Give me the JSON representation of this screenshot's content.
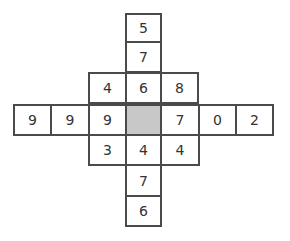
{
  "puzzle": {
    "colors": {
      "border": "#4a4a4a",
      "shaded": "#c8c8c8",
      "text": "#333333"
    },
    "cells": [
      {
        "row": 0,
        "col": 3,
        "value": "5"
      },
      {
        "row": 1,
        "col": 3,
        "value": "7"
      },
      {
        "row": 2,
        "col": 2,
        "value": "4"
      },
      {
        "row": 2,
        "col": 3,
        "value": "6"
      },
      {
        "row": 2,
        "col": 4,
        "value": "8"
      },
      {
        "row": 3,
        "col": 0,
        "value": "9"
      },
      {
        "row": 3,
        "col": 1,
        "value": "9"
      },
      {
        "row": 3,
        "col": 2,
        "value": "9"
      },
      {
        "row": 3,
        "col": 3,
        "value": "",
        "shaded": true
      },
      {
        "row": 3,
        "col": 4,
        "value": "7"
      },
      {
        "row": 3,
        "col": 5,
        "value": "0"
      },
      {
        "row": 3,
        "col": 6,
        "value": "2"
      },
      {
        "row": 4,
        "col": 2,
        "value": "3"
      },
      {
        "row": 4,
        "col": 3,
        "value": "4"
      },
      {
        "row": 4,
        "col": 4,
        "value": "4"
      },
      {
        "row": 5,
        "col": 3,
        "value": "7"
      },
      {
        "row": 6,
        "col": 3,
        "value": "6"
      }
    ]
  }
}
